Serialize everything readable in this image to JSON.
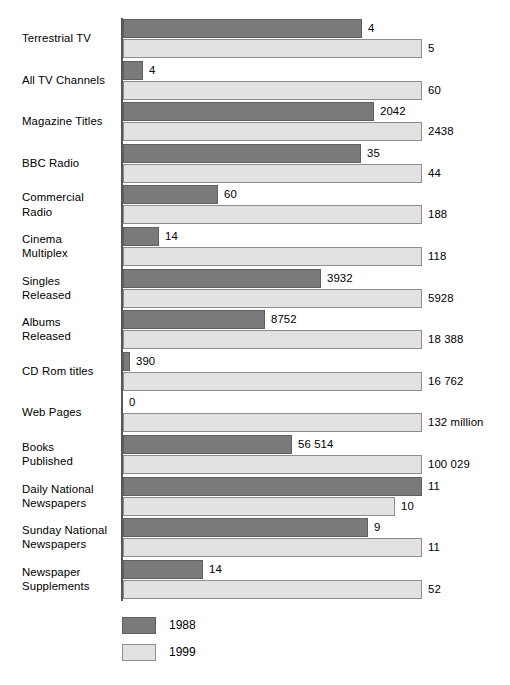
{
  "chart_data": {
    "type": "bar",
    "orientation": "horizontal",
    "title": "",
    "subtitle": "",
    "xlabel": "",
    "ylabel": "",
    "grid": false,
    "legend_position": "bottom-left",
    "scaling_note": "each category row is scaled independently; the larger of the two values fills the full bar width",
    "categories": [
      "Terrestrial TV",
      "All TV Channels",
      "Magazine Titles",
      "BBC Radio",
      "Commercial Radio",
      "Cinema Multiplex",
      "Singles Released",
      "Albums Released",
      "CD Rom titles",
      "Web Pages",
      "Books Published",
      "Daily National Newspapers",
      "Sunday National Newspapers",
      "Newspaper Supplements"
    ],
    "series": [
      {
        "name": "1988",
        "color": "#7a7a7a",
        "values": [
          4,
          4,
          2042,
          35,
          60,
          14,
          3932,
          8752,
          390,
          0,
          56514,
          11,
          9,
          14
        ],
        "labels": [
          "4",
          "4",
          "2042",
          "35",
          "60",
          "14",
          "3932",
          "8752",
          "390",
          "0",
          "56 514",
          "11",
          "9",
          "14"
        ]
      },
      {
        "name": "1999",
        "color": "#e2e2e2",
        "values": [
          5,
          60,
          2438,
          44,
          188,
          118,
          5928,
          18388,
          16762,
          132000000,
          100029,
          10,
          11,
          52
        ],
        "labels": [
          "5",
          "60",
          "2438",
          "44",
          "188",
          "118",
          "5928",
          "18 388",
          "16 762",
          "132 million",
          "100 029",
          "10",
          "11",
          "52"
        ]
      }
    ]
  },
  "rows": [
    {
      "label_lines": [
        "Terrestrial TV"
      ],
      "v1988_label": "4",
      "v1999_label": "5",
      "bar1988_pct": 80.0,
      "bar1999_pct": 100.0
    },
    {
      "label_lines": [
        "All TV Channels"
      ],
      "v1988_label": "4",
      "v1999_label": "60",
      "bar1988_pct": 6.7,
      "bar1999_pct": 100.0
    },
    {
      "label_lines": [
        "Magazine Titles"
      ],
      "v1988_label": "2042",
      "v1999_label": "2438",
      "bar1988_pct": 83.8,
      "bar1999_pct": 100.0
    },
    {
      "label_lines": [
        "BBC Radio"
      ],
      "v1988_label": "35",
      "v1999_label": "44",
      "bar1988_pct": 79.5,
      "bar1999_pct": 100.0
    },
    {
      "label_lines": [
        "Commercial",
        "Radio"
      ],
      "v1988_label": "60",
      "v1999_label": "188",
      "bar1988_pct": 31.9,
      "bar1999_pct": 100.0
    },
    {
      "label_lines": [
        "Cinema",
        "Multiplex"
      ],
      "v1988_label": "14",
      "v1999_label": "118",
      "bar1988_pct": 11.9,
      "bar1999_pct": 100.0
    },
    {
      "label_lines": [
        "Singles",
        "Released"
      ],
      "v1988_label": "3932",
      "v1999_label": "5928",
      "bar1988_pct": 66.3,
      "bar1999_pct": 100.0
    },
    {
      "label_lines": [
        "Albums",
        "Released"
      ],
      "v1988_label": "8752",
      "v1999_label": "18 388",
      "bar1988_pct": 47.6,
      "bar1999_pct": 100.0
    },
    {
      "label_lines": [
        "CD Rom titles"
      ],
      "v1988_label": "390",
      "v1999_label": "16 762",
      "bar1988_pct": 2.3,
      "bar1999_pct": 100.0
    },
    {
      "label_lines": [
        "Web Pages"
      ],
      "v1988_label": "0",
      "v1999_label": "132 million",
      "bar1988_pct": 0,
      "bar1999_pct": 100.0
    },
    {
      "label_lines": [
        "Books",
        "Published"
      ],
      "v1988_label": "56 514",
      "v1999_label": "100 029",
      "bar1988_pct": 56.5,
      "bar1999_pct": 100.0
    },
    {
      "label_lines": [
        "Daily National",
        "Newspapers"
      ],
      "v1988_label": "11",
      "v1999_label": "10",
      "bar1988_pct": 100.0,
      "bar1999_pct": 90.9
    },
    {
      "label_lines": [
        "Sunday National",
        "Newspapers"
      ],
      "v1988_label": "9",
      "v1999_label": "11",
      "bar1988_pct": 81.8,
      "bar1999_pct": 100.0
    },
    {
      "label_lines": [
        "Newspaper",
        "Supplements"
      ],
      "v1988_label": "14",
      "v1999_label": "52",
      "bar1988_pct": 26.9,
      "bar1999_pct": 100.0
    }
  ],
  "legend": {
    "items": [
      {
        "label": "1988",
        "color": "#7a7a7a"
      },
      {
        "label": "1999",
        "color": "#e2e2e2"
      }
    ]
  }
}
